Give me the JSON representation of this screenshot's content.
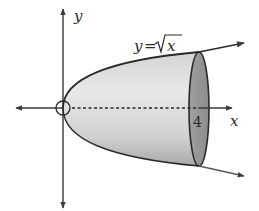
{
  "figure": {
    "type": "solid-of-revolution",
    "labels": {
      "x_axis": "x",
      "y_axis": "y",
      "curve_lhs": "y",
      "curve_eq": "=",
      "curve_rhs": "x",
      "curve_full": "y=√x",
      "x_bound": "4"
    },
    "colors": {
      "axis": "#3a3a3a",
      "curve": "#2a2a2a",
      "solid_fill_light": "#e6e6e6",
      "solid_fill_dark": "#b8b8b8",
      "end_cap": "#9a9a9a"
    }
  }
}
